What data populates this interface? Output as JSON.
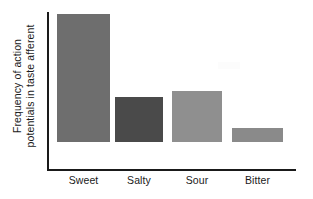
{
  "chart_data": {
    "type": "bar",
    "title": "",
    "subtitle": "",
    "xlabel": "",
    "ylabel": "Frequency of action potentials in taste afferent",
    "ylabel_lines": [
      "Frequency of action",
      "potentials in taste afferent"
    ],
    "categories": [
      "Sweet",
      "Salty",
      "Sour",
      "Bitter"
    ],
    "values": [
      100,
      35,
      40,
      11
    ],
    "ylim": [
      0,
      124
    ],
    "grid": false,
    "legend": null,
    "axis_ticks": [],
    "bar_colors": [
      "#6e6e6e",
      "#4a4a4a",
      "#8f8f8f",
      "#8a8a8a"
    ]
  },
  "axes": {
    "axis_color": "#1a1a1a",
    "y_axis_name": "y-axis-line",
    "x_axis_name": "x-axis-line"
  },
  "bars": [
    {
      "label": "Sweet",
      "value": 100,
      "color": "#6e6e6e",
      "left": 57,
      "width": 53,
      "height": 128
    },
    {
      "label": "Salty",
      "value": 35,
      "color": "#4a4a4a",
      "left": 115,
      "width": 48,
      "height": 45
    },
    {
      "label": "Sour",
      "value": 40,
      "color": "#8f8f8f",
      "left": 172,
      "width": 50,
      "height": 51
    },
    {
      "label": "Bitter",
      "value": 11,
      "color": "#8a8a8a",
      "left": 232,
      "width": 51,
      "height": 14
    }
  ],
  "xlabels": [
    {
      "text": "Sweet",
      "left": 57,
      "width": 53
    },
    {
      "text": "Salty",
      "left": 115,
      "width": 48
    },
    {
      "text": "Sour",
      "left": 172,
      "width": 50
    },
    {
      "text": "Bitter",
      "left": 232,
      "width": 51
    }
  ]
}
